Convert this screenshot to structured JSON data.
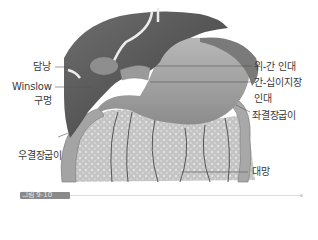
{
  "figure": {
    "labels": {
      "gallbladder": "담낭",
      "winslow_line1": "Winslow",
      "winslow_line2": "구멍",
      "hepatogastric": "위-간 인대",
      "hepatoduodenal_line1": "간-십이지장",
      "hepatoduodenal_line2": "인대",
      "left_colic_flexure": "좌결장굽이",
      "right_colic_flexure": "우결장굽이",
      "greater_omentum": "대망"
    },
    "caption": "그림 9-10",
    "colors": {
      "liver": "#5a5a5a",
      "stomach": "#9c9c9c",
      "omentum": "#c8c8c8",
      "colon": "#a8a8a8",
      "ligament": "#eeeeee",
      "leader": "#555555"
    }
  }
}
